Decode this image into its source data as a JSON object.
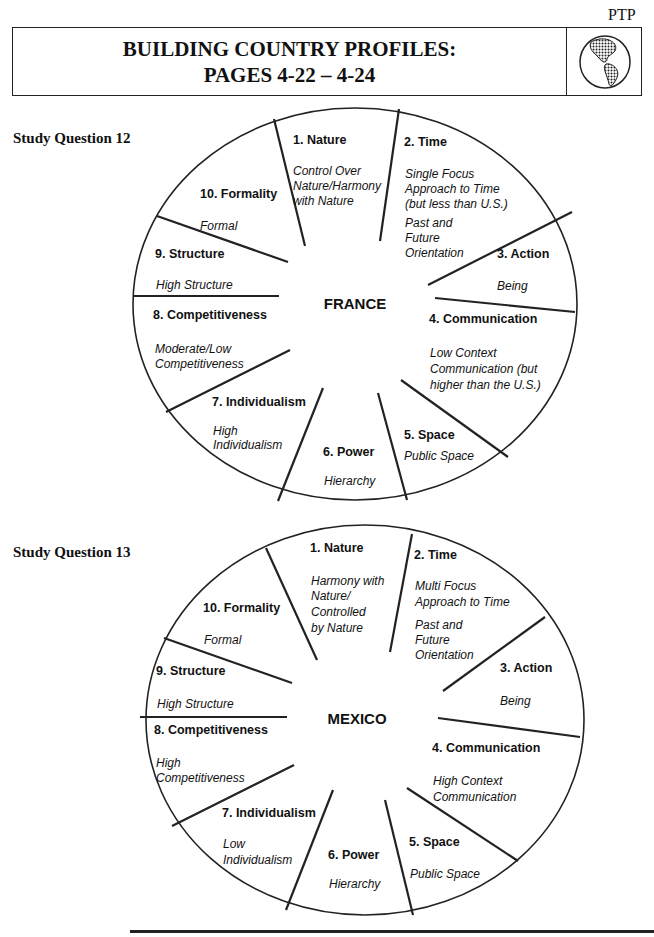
{
  "header": {
    "corner_label": "PTP",
    "title_line1": "BUILDING COUNTRY PROFILES:",
    "title_line2": "PAGES 4-22 – 4-24",
    "icon": "globe-icon"
  },
  "france": {
    "question": "Study Question 12",
    "center": "FRANCE",
    "segments": [
      {
        "label": "1. Nature",
        "value_lines": [
          "Control Over",
          "Nature/Harmony",
          "with Nature"
        ]
      },
      {
        "label": "2. Time",
        "value_lines": [
          "Single Focus",
          "Approach to Time",
          "(but less  than U.S.)",
          "Past and",
          "Future",
          "Orientation"
        ]
      },
      {
        "label": "3. Action",
        "value_lines": [
          "Being"
        ]
      },
      {
        "label": "4. Communication",
        "value_lines": [
          "Low Context",
          "Communication (but",
          "higher than the U.S.)"
        ]
      },
      {
        "label": "5.  Space",
        "value_lines": [
          "Public Space"
        ]
      },
      {
        "label": "6. Power",
        "value_lines": [
          "Hierarchy"
        ]
      },
      {
        "label": "7. Individualism",
        "value_lines": [
          "High",
          "Individualism"
        ]
      },
      {
        "label": "8.  Competitiveness",
        "value_lines": [
          "Moderate/Low",
          "Competitiveness"
        ]
      },
      {
        "label": "9. Structure",
        "value_lines": [
          "High Structure"
        ]
      },
      {
        "label": "10. Formality",
        "value_lines": [
          "Formal"
        ]
      }
    ]
  },
  "mexico": {
    "question": "Study Question 13",
    "center": "MEXICO",
    "segments": [
      {
        "label": "1. Nature",
        "value_lines": [
          "Harmony with",
          "Nature/",
          "Controlled",
          "by Nature"
        ]
      },
      {
        "label": "2. Time",
        "value_lines": [
          "Multi Focus",
          "Approach to Time",
          "Past and",
          "Future",
          "Orientation"
        ]
      },
      {
        "label": "3. Action",
        "value_lines": [
          "Being"
        ]
      },
      {
        "label": "4. Communication",
        "value_lines": [
          "High Context",
          "Communication"
        ]
      },
      {
        "label": "5.  Space",
        "value_lines": [
          "Public Space"
        ]
      },
      {
        "label": "6. Power",
        "value_lines": [
          "Hierarchy"
        ]
      },
      {
        "label": "7. Individualism",
        "value_lines": [
          "Low",
          "Individualism"
        ]
      },
      {
        "label": "8.  Competitiveness",
        "value_lines": [
          "High",
          "Competitiveness"
        ]
      },
      {
        "label": "9. Structure",
        "value_lines": [
          "High Structure"
        ]
      },
      {
        "label": "10. Formality",
        "value_lines": [
          "Formal"
        ]
      }
    ]
  }
}
